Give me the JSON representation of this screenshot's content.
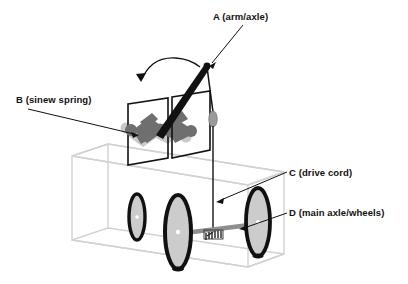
{
  "figure": {
    "background_color": "#ffffff",
    "ink_color": "#111111"
  },
  "callouts": [
    {
      "key": "A",
      "label": "A (arm/axle)",
      "text_x": 213,
      "text_y": 20,
      "leader": {
        "x1": 243,
        "y1": 25,
        "x2": 209,
        "y2": 66
      },
      "target": "throwing-arm-pivot"
    },
    {
      "key": "B",
      "label": "B (sinew spring)",
      "text_x": 16,
      "text_y": 103,
      "leader": {
        "x1": 28,
        "y1": 109,
        "x2": 139,
        "y2": 135
      },
      "target": "sinew-spring"
    },
    {
      "key": "C",
      "label": "C (drive cord)",
      "text_x": 289,
      "text_y": 176,
      "leader": {
        "x1": 287,
        "y1": 172,
        "x2": 216,
        "y2": 202
      },
      "target": "drive-cord"
    },
    {
      "key": "D",
      "label": "D (main axle/wheels)",
      "text_x": 289,
      "text_y": 216,
      "leader": {
        "x1": 287,
        "y1": 213,
        "x2": 239,
        "y2": 229
      },
      "target": "main-axle-wheels"
    }
  ],
  "parts": {
    "throwing_arm": {
      "name": "throwing arm",
      "color": "#111111",
      "tip_x": 207,
      "tip_y": 66,
      "base_x": 159,
      "base_y": 136
    },
    "rotation_arrow": {
      "name": "arm swing direction",
      "color": "#111111",
      "direction": "counter-clockwise"
    },
    "sinew_spring": {
      "name": "sinew spring skein",
      "color": "#707070",
      "ghost_color": "#c4c4c4"
    },
    "spring_plates": {
      "name": "spring frame plates",
      "count": 2,
      "color": "#111111"
    },
    "drive_cord": {
      "name": "drive cord",
      "color": "#222222",
      "top_x": 209,
      "top_y": 72,
      "bottom_y": 232
    },
    "cord_pouch": {
      "name": "cord pouch weight",
      "color": "#9a9a9a"
    },
    "chassis": {
      "name": "chassis wireframe box",
      "color": "#d2d2d2"
    },
    "main_axle": {
      "name": "main axle",
      "color": "#8f8f8f",
      "winding_color": "#3a3a3a"
    },
    "wheels": [
      {
        "name": "rear-left wheel",
        "cx": 137,
        "cy": 217,
        "rx": 8,
        "ry": 23,
        "size": "small"
      },
      {
        "name": "front-left main wheel",
        "cx": 178,
        "cy": 232,
        "rx": 13,
        "ry": 37,
        "size": "large"
      },
      {
        "name": "front-right main wheel",
        "cx": 258,
        "cy": 222,
        "rx": 12,
        "ry": 34,
        "size": "large"
      }
    ],
    "wheel_style": {
      "rim_color": "#111111",
      "face_color": "#cccccc",
      "hub_color": "#ffffff"
    }
  }
}
